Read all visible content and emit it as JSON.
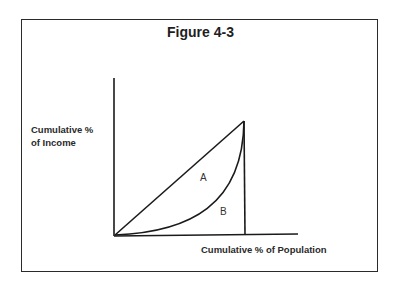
{
  "figure": {
    "title": "Figure 4-3",
    "y_axis_label_line1": "Cumulative %",
    "y_axis_label_line2": "of Income",
    "x_axis_label": "Cumulative % of Population",
    "regions": {
      "a": "A",
      "b": "B"
    },
    "line_color": "#1a1a1a"
  }
}
